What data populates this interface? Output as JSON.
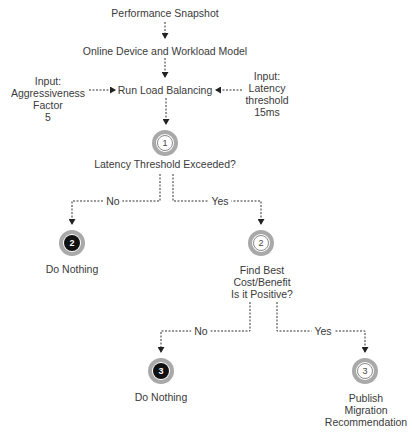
{
  "diagram": {
    "title_nodes": {
      "snapshot": "Performance Snapshot",
      "model": "Online Device and Workload Model",
      "run": "Run Load Balancing"
    },
    "input_left": [
      "Input:",
      "Aggressiveness",
      "Factor",
      "5"
    ],
    "input_right": [
      "Input:",
      "Latency",
      "threshold",
      "15ms"
    ],
    "decision1": {
      "step": "1",
      "label": "Latency Threshold Exceeded?",
      "no_label": "No",
      "yes_label": "Yes"
    },
    "no1": {
      "step": "2",
      "label": "Do Nothing"
    },
    "yes1": {
      "step": "2",
      "lines": [
        "Find Best",
        "Cost/Benefit",
        "Is it Positive?"
      ],
      "no_label": "No",
      "yes_label": "Yes"
    },
    "no2": {
      "step": "3",
      "label": "Do Nothing"
    },
    "yes2": {
      "step": "3",
      "lines": [
        "Publish",
        "Migration",
        "Recommendation"
      ]
    },
    "colors": {
      "line": "#333333",
      "ring": "#a9a9a9",
      "filled": "#111111",
      "text": "#3a3a3a"
    }
  }
}
